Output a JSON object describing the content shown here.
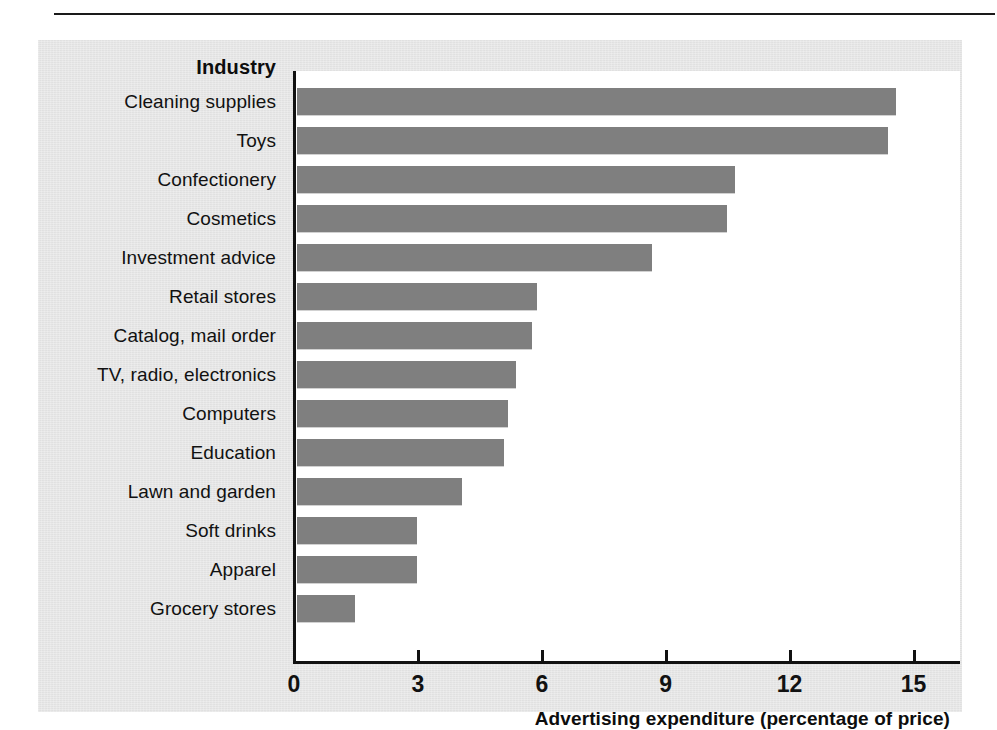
{
  "scan": {
    "top_fragment": ""
  },
  "chart_data": {
    "type": "bar",
    "orientation": "horizontal",
    "title": "",
    "category_axis_title": "Industry",
    "xlabel": "Advertising expenditure (percentage of price)",
    "ylabel": "",
    "xlim": [
      0,
      15.6
    ],
    "xticks": [
      0,
      3,
      6,
      9,
      12,
      15
    ],
    "xticklabels": [
      "0",
      "3",
      "6",
      "9",
      "12",
      "15"
    ],
    "grid": false,
    "legend": null,
    "bar_color": "#7f7f7f",
    "panel_color": "#e6e6e6",
    "plot_background": "#ffffff",
    "categories": [
      "Cleaning supplies",
      "Toys",
      "Confectionery",
      "Cosmetics",
      "Investment advice",
      "Retail stores",
      "Catalog, mail order",
      "TV, radio, electronics",
      "Computers",
      "Education",
      "Lawn and garden",
      "Soft drinks",
      "Apparel",
      "Grocery stores"
    ],
    "values": [
      14.5,
      14.3,
      10.6,
      10.4,
      8.6,
      5.8,
      5.7,
      5.3,
      5.1,
      5.0,
      4.0,
      2.9,
      2.9,
      1.4
    ]
  }
}
